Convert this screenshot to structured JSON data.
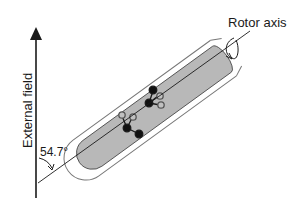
{
  "diagram": {
    "title": "",
    "labels": {
      "external_field": "External field",
      "rotor_axis": "Rotor axis",
      "angle": "54.7°"
    },
    "elements": [
      {
        "id": "external-field-arrow",
        "type": "arrow",
        "direction": "up"
      },
      {
        "id": "rotor",
        "type": "cylinder",
        "tilt_deg": 54.7
      },
      {
        "id": "rotor-axis-line",
        "type": "line"
      },
      {
        "id": "rotation-arrow",
        "type": "curved-arrow"
      },
      {
        "id": "angle-arc",
        "type": "curved-arrow"
      },
      {
        "id": "molecule-1",
        "type": "molecule"
      },
      {
        "id": "molecule-2",
        "type": "molecule"
      }
    ],
    "colors": {
      "rotor_fill": "#b8b8b8",
      "stroke": "#1a1a1a",
      "tube_stroke": "#777777"
    }
  }
}
